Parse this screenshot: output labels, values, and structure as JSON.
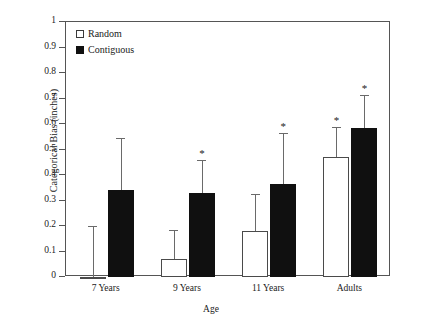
{
  "chart_data": {
    "type": "bar",
    "title": "",
    "xlabel": "Age",
    "ylabel": "Categorical Bias (inches)",
    "categories": [
      "7 Years",
      "9 Years",
      "11 Years",
      "Adults"
    ],
    "ylim": [
      0,
      1
    ],
    "yticks": [
      "0",
      "0.1",
      "0.2",
      "0.3",
      "0.4",
      "0.5",
      "0.6",
      "0.7",
      "0.8",
      "0.9",
      "1"
    ],
    "ytick_values": [
      0,
      0.1,
      0.2,
      0.3,
      0.4,
      0.5,
      0.6,
      0.7,
      0.8,
      0.9,
      1
    ],
    "grid": false,
    "legend_position": "top-left",
    "series": [
      {
        "name": "Random",
        "swatch": "open-square",
        "values": [
          0.0,
          0.07,
          0.18,
          0.47
        ],
        "error_upper": [
          0.2,
          0.185,
          0.325,
          0.59
        ],
        "significant": [
          false,
          false,
          false,
          true
        ]
      },
      {
        "name": "Contiguous",
        "swatch": "filled-square",
        "values": [
          0.34,
          0.33,
          0.365,
          0.585
        ],
        "error_upper": [
          0.545,
          0.46,
          0.565,
          0.715
        ],
        "significant": [
          false,
          true,
          true,
          true
        ]
      }
    ],
    "annotation_symbol": "*"
  },
  "legend": {
    "items": [
      {
        "label": "Random",
        "swatch": "open-square"
      },
      {
        "label": "Contiguous",
        "swatch": "filled-square"
      }
    ]
  },
  "axes": {
    "y_title": "Categorical Bias (inches)",
    "x_title": "Age"
  },
  "colors": {
    "random_fill": "#ffffff",
    "contiguous_fill": "#101010",
    "axis": "#555555",
    "error": "#6a6a6a",
    "background": "#ffffff"
  }
}
